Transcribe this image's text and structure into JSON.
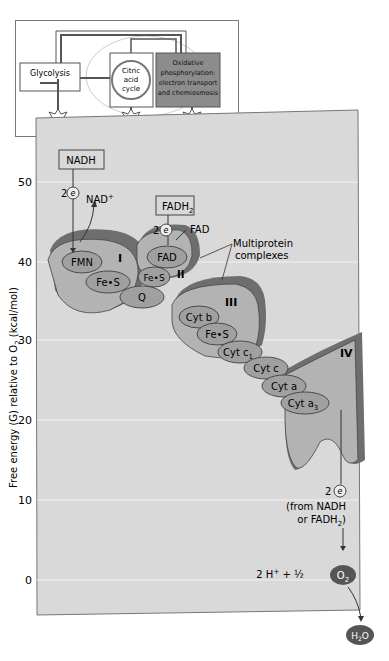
{
  "inset": {
    "glycolysis": "Glycolysis",
    "citric": [
      "Citric",
      "acid",
      "cycle"
    ],
    "oxphos": [
      "Oxidative",
      "phosphorylation:",
      "electron transport",
      "and chemiosmosis"
    ],
    "atp": [
      "ATP",
      "ATP",
      "ATP"
    ]
  },
  "axis": {
    "label": "Free energy (G) relative to O",
    "label_sub": "2",
    "label_tail": " (kcal/mol)",
    "ticks": [
      "50",
      "40",
      "30",
      "20",
      "10",
      "0"
    ]
  },
  "nadh": {
    "box": "NADH",
    "two": "2",
    "e": "e",
    "nadplus": "NAD",
    "plus": "+"
  },
  "fadh2": {
    "box": "FADH",
    "sub": "2",
    "two": "2",
    "e": "e",
    "fad": "FAD"
  },
  "multiprotein": [
    "Multiprotein",
    "complexes"
  ],
  "complexes": {
    "I": "I",
    "II": "II",
    "III": "III",
    "IV": "IV"
  },
  "carriers": {
    "fmn": "FMN",
    "fes1": "Fe•S",
    "fad": "FAD",
    "fes2": "Fe•S",
    "q": "Q",
    "cytb": "Cyt b",
    "fes3": "Fe•S",
    "cytc1": "Cyt c",
    "cytc1_sub": "1",
    "cytc": "Cyt c",
    "cyta": "Cyt a",
    "cyta3": "Cyt a",
    "cyta3_sub": "3"
  },
  "bottom": {
    "two": "2",
    "e": "e",
    "from1": "(from NADH",
    "from2": "or FADH",
    "from2_sub": "2",
    "from2_end": ")",
    "eq": "2 H",
    "eq_plus": "+",
    "eq_mid": " + ½",
    "o2": "O",
    "o2_sub": "2",
    "h2o_h": "H",
    "h2o_sub": "2",
    "h2o_o": "O"
  },
  "colors": {
    "panel": "#d9d9d9",
    "complex_fill": "#b3b3b3",
    "complex_dark": "#6e6e6e",
    "carrier": "#a0a0a0",
    "oxphos_box": "#8c8c8c",
    "o2": "#555555"
  }
}
